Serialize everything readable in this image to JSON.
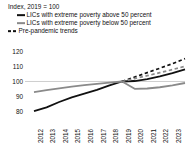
{
  "header": {
    "title": "Index, 2019 = 100",
    "legend": [
      {
        "label": "LICs with extreme poverty above 50 percent",
        "marker": "solid-line-black-icon",
        "color": "#111111",
        "style": "solid"
      },
      {
        "label": "LICs with extreme poverty below 50 percent",
        "marker": "solid-line-gray-icon",
        "color": "#8a8a8a",
        "style": "solid"
      },
      {
        "label": "Pre-pandemic trends",
        "marker": "dashed-line-icon",
        "color": "#111111",
        "style": "dashed"
      }
    ]
  },
  "chart_data": {
    "type": "line",
    "title": "Index, 2019 = 100",
    "xlabel": "",
    "ylabel": "",
    "x": [
      2012,
      2013,
      2014,
      2015,
      2016,
      2017,
      2018,
      2019,
      2020,
      2021,
      2022,
      2023,
      2024
    ],
    "xticklabels": [
      "2012",
      "2013",
      "2014",
      "2015",
      "2016",
      "2017",
      "2018",
      "2019",
      "2020",
      "2021",
      "2022",
      "2023",
      "2024"
    ],
    "yticks": [
      80,
      90,
      100,
      110,
      120
    ],
    "yticklabels": [
      "80",
      "90",
      "100",
      "110",
      "120"
    ],
    "ylim": [
      76,
      122
    ],
    "xlim": [
      2012,
      2024
    ],
    "grid": "y-gridline-at-100-only",
    "legend_position": "top-left-above-axes",
    "series": [
      {
        "name": "LICs with extreme poverty above 50 percent",
        "color": "#111111",
        "style": "solid",
        "x": [
          2012,
          2013,
          2014,
          2015,
          2016,
          2017,
          2018,
          2019,
          2020,
          2021,
          2022,
          2023,
          2024
        ],
        "values": [
          80.5,
          83.0,
          86.5,
          89.5,
          92.0,
          94.5,
          97.5,
          100.0,
          100.3,
          101.5,
          103.3,
          105.5,
          108.0
        ]
      },
      {
        "name": "LICs with extreme poverty below 50 percent",
        "color": "#8a8a8a",
        "style": "solid",
        "x": [
          2012,
          2013,
          2014,
          2015,
          2016,
          2017,
          2018,
          2019,
          2020,
          2021,
          2022,
          2023,
          2024
        ],
        "values": [
          93.0,
          94.3,
          95.5,
          96.6,
          97.6,
          98.4,
          99.2,
          100.0,
          95.2,
          95.4,
          96.2,
          97.4,
          99.0
        ]
      },
      {
        "name": "Pre-pandemic trends (above 50 percent)",
        "color": "#111111",
        "style": "dashed",
        "x": [
          2019,
          2020,
          2021,
          2022,
          2023,
          2024
        ],
        "values": [
          100.0,
          102.9,
          105.8,
          108.7,
          111.7,
          115.0
        ]
      },
      {
        "name": "Pre-pandemic trends (below 50 percent)",
        "color": "#8a8a8a",
        "style": "dashed",
        "x": [
          2019,
          2020,
          2021,
          2022,
          2023,
          2024
        ],
        "values": [
          100.0,
          101.9,
          103.8,
          105.8,
          107.8,
          110.0
        ]
      }
    ]
  }
}
